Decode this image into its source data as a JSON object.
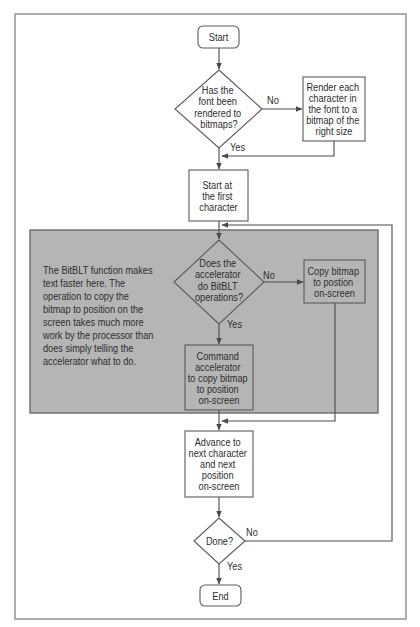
{
  "colors": {
    "highlight_fill": "#b5b5b5",
    "line": "#4a4a4a",
    "text": "#2e2e2e",
    "frame": "#9a9a9a"
  },
  "nodes": {
    "start": {
      "type": "terminal",
      "lines": [
        "Start"
      ]
    },
    "q_rendered": {
      "type": "decision",
      "lines": [
        "Has the",
        "font been",
        "rendered to",
        "bitmaps?"
      ]
    },
    "render": {
      "type": "process",
      "lines": [
        "Render each",
        "character in",
        "the font to a",
        "bitmap of the",
        "right size"
      ]
    },
    "start_first": {
      "type": "process",
      "lines": [
        "Start at",
        "the first",
        "character"
      ]
    },
    "q_accel": {
      "type": "decision",
      "lines": [
        "Does the",
        "accelerator",
        "do BitBLT",
        "operations?"
      ]
    },
    "copy": {
      "type": "process",
      "lines": [
        "Copy bitmap",
        "to postion",
        "on-screen"
      ]
    },
    "command": {
      "type": "process",
      "lines": [
        "Command",
        "accelerator",
        "to copy bitmap",
        "to position",
        "on-screen"
      ]
    },
    "advance": {
      "type": "process",
      "lines": [
        "Advance to",
        "next character",
        "and next",
        "position",
        "on-screen"
      ]
    },
    "done": {
      "type": "decision",
      "lines": [
        "Done?"
      ]
    },
    "end": {
      "type": "terminal",
      "lines": [
        "End"
      ]
    }
  },
  "edge_labels": {
    "q_rendered_no": "No",
    "q_rendered_yes": "Yes",
    "q_accel_no": "No",
    "q_accel_yes": "Yes",
    "done_no": "No",
    "done_yes": "Yes"
  },
  "edges": [
    {
      "from": "start",
      "to": "q_rendered"
    },
    {
      "from": "q_rendered",
      "to": "render",
      "label": "No"
    },
    {
      "from": "q_rendered",
      "to": "start_first",
      "label": "Yes"
    },
    {
      "from": "render",
      "to": "start_first"
    },
    {
      "from": "start_first",
      "to": "q_accel"
    },
    {
      "from": "q_accel",
      "to": "copy",
      "label": "No"
    },
    {
      "from": "q_accel",
      "to": "command",
      "label": "Yes"
    },
    {
      "from": "copy",
      "to": "advance"
    },
    {
      "from": "command",
      "to": "advance"
    },
    {
      "from": "advance",
      "to": "done"
    },
    {
      "from": "done",
      "to": "q_accel",
      "label": "No"
    },
    {
      "from": "done",
      "to": "end",
      "label": "Yes"
    }
  ],
  "note": {
    "lines": [
      "The BitBLT function makes",
      "text faster here. The",
      "operation to copy the",
      "bitmap to position on the",
      "screen takes much more",
      "work by the processor than",
      "does simply telling the",
      "accelerator what to do."
    ]
  }
}
